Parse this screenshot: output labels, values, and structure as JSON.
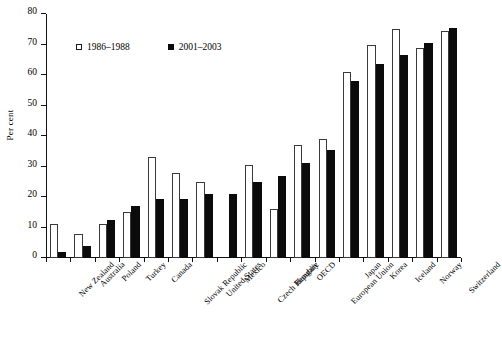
{
  "chart_data": {
    "type": "bar",
    "title": "",
    "xlabel": "",
    "ylabel": "Per cent",
    "ylim": [
      0,
      80
    ],
    "yticks": [
      0,
      10,
      20,
      30,
      40,
      50,
      60,
      70,
      80
    ],
    "grid": false,
    "legend_position": "top-left-inside",
    "categories": [
      "New Zealand",
      "Australia",
      "Poland",
      "Turkey",
      "Canada",
      "Slovak Republic",
      "United States",
      "Mexico",
      "Czech Republic",
      "Hungary",
      "OECD",
      "European Union",
      "Japan",
      "Korea",
      "Iceland",
      "Norway",
      "Switzerland"
    ],
    "series": [
      {
        "name": "1986–1988",
        "style": "hollow",
        "color": "#ffffff",
        "edge_color": "#3a3a3a",
        "values": [
          11,
          8,
          11,
          15,
          33,
          28,
          25,
          null,
          30.5,
          16,
          37,
          39,
          61,
          70,
          75,
          69,
          74.5
        ]
      },
      {
        "name": "2001–2003",
        "style": "filled",
        "color": "#0b0b0b",
        "edge_color": "#0b0b0b",
        "values": [
          2,
          4,
          12.5,
          17,
          19.5,
          19.5,
          21,
          21,
          25,
          27,
          31,
          35.5,
          58,
          63.5,
          66.5,
          70.5,
          75.5
        ]
      }
    ]
  },
  "legend": {
    "items": [
      {
        "label": "1986–1988",
        "style": "hollow"
      },
      {
        "label": "2001–2003",
        "style": "filled"
      }
    ]
  }
}
